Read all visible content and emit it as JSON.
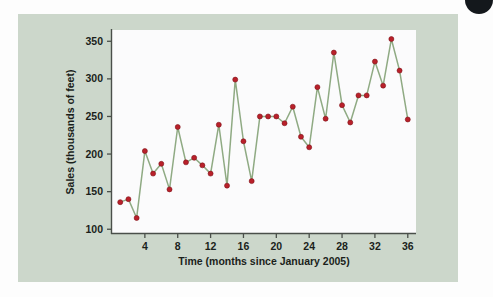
{
  "figure": {
    "panel_bg_color": "#ccd7cb",
    "page_bg_color": "#fdfdfd",
    "corner_marker": "page-corner-dot"
  },
  "chart_data": {
    "type": "line",
    "title": "",
    "subtitle": "",
    "xlabel": "Time (months since January 2005)",
    "ylabel": "Sales (thousands of feet)",
    "xlim": [
      0,
      37
    ],
    "ylim": [
      95,
      365
    ],
    "xticks": [
      4,
      8,
      12,
      16,
      20,
      24,
      28,
      32,
      36
    ],
    "yticks": [
      100,
      150,
      200,
      250,
      300,
      350
    ],
    "grid": false,
    "legend": null,
    "line_color": "#8faa83",
    "marker_color": "#b9202a",
    "plot_bg_color": "#fbfbfc",
    "x": [
      1,
      2,
      3,
      4,
      5,
      6,
      7,
      8,
      9,
      10,
      11,
      12,
      13,
      14,
      15,
      16,
      17,
      18,
      19,
      20,
      21,
      22,
      23,
      24,
      25,
      26,
      27,
      28,
      29,
      30,
      31,
      32,
      33,
      34,
      35,
      36
    ],
    "values": [
      136,
      140,
      115,
      204,
      174,
      187,
      153,
      236,
      189,
      195,
      185,
      174,
      239,
      158,
      299,
      217,
      164,
      250,
      250,
      250,
      241,
      263,
      223,
      209,
      289,
      247,
      335,
      265,
      242,
      278,
      278,
      323,
      291,
      353,
      311,
      246
    ]
  },
  "axis": {
    "x_tick_labels": [
      "4",
      "8",
      "12",
      "16",
      "20",
      "24",
      "28",
      "32",
      "36"
    ],
    "y_tick_labels": [
      "100",
      "150",
      "200",
      "250",
      "300",
      "350"
    ]
  }
}
